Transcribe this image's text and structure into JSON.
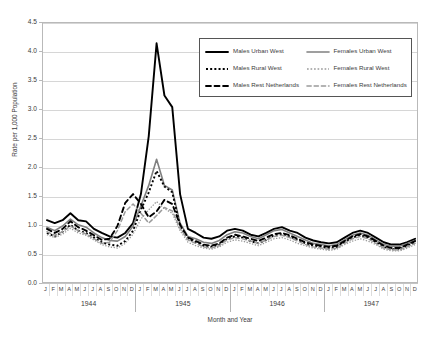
{
  "chart_data": {
    "type": "line",
    "title": "",
    "xlabel": "Month and Year",
    "ylabel": "Rate per 1,000 Population",
    "ylim": [
      0.0,
      4.5
    ],
    "ytick_labels": [
      "0.0",
      "0.5",
      "1.0",
      "1.5",
      "2.0",
      "2.5",
      "3.0",
      "3.5",
      "4.0",
      "4.5"
    ],
    "ytick_values": [
      0.0,
      0.5,
      1.0,
      1.5,
      2.0,
      2.5,
      3.0,
      3.5,
      4.0,
      4.5
    ],
    "grid": true,
    "legend_position": "top-right",
    "months": [
      "J",
      "F",
      "M",
      "A",
      "M",
      "J",
      "J",
      "A",
      "S",
      "O",
      "N",
      "D"
    ],
    "years": [
      "1944",
      "1945",
      "1946",
      "1947"
    ],
    "categories": [
      "J 1944",
      "F 1944",
      "M 1944",
      "A 1944",
      "M 1944",
      "J 1944",
      "J 1944",
      "A 1944",
      "S 1944",
      "O 1944",
      "N 1944",
      "D 1944",
      "J 1945",
      "F 1945",
      "M 1945",
      "A 1945",
      "M 1945",
      "J 1945",
      "J 1945",
      "A 1945",
      "S 1945",
      "O 1945",
      "N 1945",
      "D 1945",
      "J 1946",
      "F 1946",
      "M 1946",
      "A 1946",
      "M 1946",
      "J 1946",
      "J 1946",
      "A 1946",
      "S 1946",
      "O 1946",
      "N 1946",
      "D 1946",
      "J 1947",
      "F 1947",
      "M 1947",
      "A 1947",
      "M 1947",
      "J 1947",
      "J 1947",
      "A 1947",
      "S 1947",
      "O 1947",
      "N 1947",
      "D 1947"
    ],
    "series": [
      {
        "name": "Males Urban West",
        "color": "#000000",
        "style": "solid",
        "width": 1.9,
        "values": [
          1.1,
          1.05,
          1.1,
          1.22,
          1.1,
          1.08,
          0.95,
          0.88,
          0.82,
          0.8,
          0.88,
          1.05,
          1.55,
          2.55,
          4.15,
          3.25,
          3.05,
          1.55,
          0.95,
          0.88,
          0.8,
          0.78,
          0.82,
          0.92,
          0.95,
          0.92,
          0.85,
          0.82,
          0.88,
          0.95,
          0.98,
          0.92,
          0.88,
          0.8,
          0.75,
          0.72,
          0.7,
          0.72,
          0.8,
          0.88,
          0.92,
          0.88,
          0.8,
          0.72,
          0.68,
          0.68,
          0.72,
          0.78
        ]
      },
      {
        "name": "Females Urban West",
        "color": "#808080",
        "style": "solid",
        "width": 1.6,
        "values": [
          0.98,
          0.92,
          1.0,
          1.12,
          1.02,
          0.98,
          0.88,
          0.8,
          0.75,
          0.74,
          0.82,
          1.0,
          1.35,
          1.7,
          2.15,
          1.7,
          1.62,
          1.05,
          0.82,
          0.78,
          0.72,
          0.7,
          0.75,
          0.85,
          0.9,
          0.88,
          0.82,
          0.78,
          0.85,
          0.92,
          0.94,
          0.88,
          0.82,
          0.76,
          0.7,
          0.68,
          0.66,
          0.68,
          0.76,
          0.84,
          0.88,
          0.84,
          0.76,
          0.68,
          0.65,
          0.65,
          0.7,
          0.75
        ]
      },
      {
        "name": "Males Rural West",
        "color": "#000000",
        "style": "dotted",
        "width": 1.9,
        "values": [
          0.88,
          0.82,
          0.9,
          1.02,
          0.92,
          0.88,
          0.8,
          0.72,
          0.68,
          0.66,
          0.74,
          0.92,
          1.28,
          1.58,
          1.95,
          1.68,
          1.58,
          1.0,
          0.78,
          0.72,
          0.66,
          0.64,
          0.68,
          0.78,
          0.82,
          0.8,
          0.74,
          0.7,
          0.76,
          0.84,
          0.86,
          0.82,
          0.76,
          0.7,
          0.66,
          0.64,
          0.62,
          0.64,
          0.72,
          0.8,
          0.84,
          0.8,
          0.72,
          0.64,
          0.6,
          0.6,
          0.66,
          0.72
        ]
      },
      {
        "name": "Females Rural West",
        "color": "#9a9a9a",
        "style": "dotted",
        "width": 1.3,
        "values": [
          0.85,
          0.8,
          0.86,
          0.96,
          0.88,
          0.84,
          0.76,
          0.68,
          0.64,
          0.62,
          0.7,
          0.86,
          1.12,
          1.28,
          1.42,
          1.3,
          1.22,
          0.92,
          0.72,
          0.66,
          0.62,
          0.6,
          0.64,
          0.72,
          0.76,
          0.74,
          0.7,
          0.66,
          0.72,
          0.78,
          0.8,
          0.76,
          0.7,
          0.66,
          0.62,
          0.6,
          0.58,
          0.6,
          0.68,
          0.74,
          0.78,
          0.74,
          0.68,
          0.6,
          0.57,
          0.57,
          0.62,
          0.68
        ]
      },
      {
        "name": "Males Rest Netherlands",
        "color": "#000000",
        "style": "dashed",
        "width": 1.9,
        "values": [
          0.95,
          0.88,
          0.95,
          1.08,
          0.98,
          0.92,
          0.84,
          0.76,
          0.78,
          1.0,
          1.4,
          1.55,
          1.38,
          1.15,
          1.25,
          1.45,
          1.38,
          1.02,
          0.8,
          0.74,
          0.68,
          0.66,
          0.7,
          0.8,
          0.85,
          0.82,
          0.78,
          0.74,
          0.8,
          0.86,
          0.88,
          0.84,
          0.78,
          0.72,
          0.68,
          0.66,
          0.64,
          0.66,
          0.74,
          0.82,
          0.86,
          0.82,
          0.74,
          0.66,
          0.62,
          0.62,
          0.68,
          0.74
        ]
      },
      {
        "name": "Females Rest Netherlands",
        "color": "#9a9a9a",
        "style": "dashed",
        "width": 1.5,
        "values": [
          0.9,
          0.84,
          0.9,
          1.0,
          0.92,
          0.86,
          0.78,
          0.7,
          0.72,
          0.92,
          1.25,
          1.38,
          1.22,
          1.05,
          1.18,
          1.32,
          1.26,
          0.96,
          0.76,
          0.7,
          0.64,
          0.62,
          0.66,
          0.76,
          0.8,
          0.78,
          0.74,
          0.7,
          0.76,
          0.82,
          0.84,
          0.8,
          0.74,
          0.68,
          0.64,
          0.62,
          0.6,
          0.62,
          0.7,
          0.78,
          0.82,
          0.78,
          0.7,
          0.62,
          0.59,
          0.59,
          0.64,
          0.7
        ]
      }
    ]
  },
  "legend": {
    "items": [
      {
        "label": "Males Urban West"
      },
      {
        "label": "Females Urban West"
      },
      {
        "label": "Males Rural West"
      },
      {
        "label": "Females Rural West"
      },
      {
        "label": "Males Rest Netherlands"
      },
      {
        "label": "Females Rest Netherlands"
      }
    ]
  }
}
